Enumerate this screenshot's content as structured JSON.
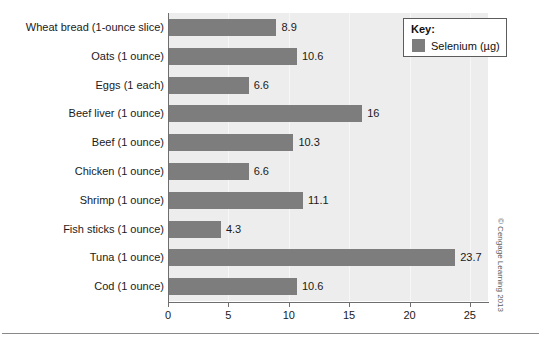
{
  "chart_data": {
    "type": "bar",
    "orientation": "horizontal",
    "title": "",
    "xlabel": "",
    "ylabel": "",
    "xlim": [
      0,
      26.5
    ],
    "grid": true,
    "legend_position": "top-right",
    "categories": [
      "Wheat bread (1-ounce slice)",
      "Oats (1 ounce)",
      "Eggs (1 each)",
      "Beef liver (1 ounce)",
      "Beef (1 ounce)",
      "Chicken (1 ounce)",
      "Shrimp (1 ounce)",
      "Fish sticks (1 ounce)",
      "Tuna (1 ounce)",
      "Cod (1 ounce)"
    ],
    "values": [
      8.9,
      10.6,
      6.6,
      16,
      10.3,
      6.6,
      11.1,
      4.3,
      23.7,
      10.6
    ],
    "value_labels": [
      "8.9",
      "10.6",
      "6.6",
      "16",
      "10.3",
      "6.6",
      "11.1",
      "4.3",
      "23.7",
      "10.6"
    ],
    "series": [
      {
        "name": "Selenium (µg)",
        "color": "#7d7d7d",
        "values": [
          8.9,
          10.6,
          6.6,
          16,
          10.3,
          6.6,
          11.1,
          4.3,
          23.7,
          10.6
        ]
      }
    ],
    "xticks": [
      0,
      5,
      10,
      15,
      20,
      25
    ],
    "xtick_labels": [
      "0",
      "5",
      "10",
      "15",
      "20",
      "25"
    ]
  },
  "legend": {
    "title": "Key:",
    "entry_label": "Selenium (µg)",
    "swatch_color": "#7d7d7d",
    "border_color": "#5c5c5c"
  },
  "colors": {
    "bar": "#7d7d7d",
    "plot_background": "#ededed",
    "gridline": "#f7f7f7",
    "axis": "#6e6e6e",
    "text": "#1a1a1a",
    "page_background": "#ffffff"
  },
  "credit": "© Cengage Learning 2013"
}
